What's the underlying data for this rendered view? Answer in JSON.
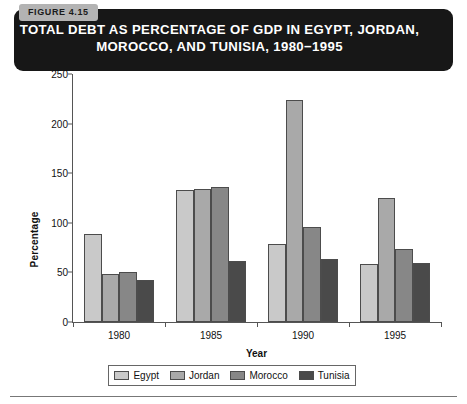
{
  "figure": {
    "tab_label": "FIGURE 4.15",
    "title_line1": "TOTAL DEBT AS PERCENTAGE OF GDP IN EGYPT, JORDAN,",
    "title_line2": "MOROCCO, AND TUNISIA, 1980−1995",
    "header_bg": "#171717",
    "tab_bg": "#b3b3b3"
  },
  "chart_data": {
    "type": "bar",
    "title": "TOTAL DEBT AS PERCENTAGE OF GDP IN EGYPT, JORDAN, MOROCCO, AND TUNISIA, 1980−1995",
    "xlabel": "Year",
    "ylabel": "Percentage",
    "categories": [
      "1980",
      "1985",
      "1990",
      "1995"
    ],
    "series": [
      {
        "name": "Egypt",
        "color": "#c9c9c9",
        "values": [
          89,
          133,
          79,
          58
        ]
      },
      {
        "name": "Jordan",
        "color": "#a9a9a9",
        "values": [
          48,
          134,
          224,
          125
        ]
      },
      {
        "name": "Morocco",
        "color": "#878787",
        "values": [
          50,
          136,
          96,
          74
        ]
      },
      {
        "name": "Tunisia",
        "color": "#4a4a4a",
        "values": [
          42,
          62,
          64,
          59
        ]
      }
    ],
    "ylim": [
      0,
      250
    ],
    "yticks": [
      0,
      50,
      100,
      150,
      200,
      250
    ],
    "grid": false,
    "legend_position": "bottom"
  }
}
